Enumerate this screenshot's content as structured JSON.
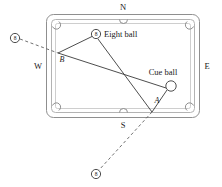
{
  "figure": {
    "type": "billiards-table-diagram",
    "title": "",
    "compass_labels": {
      "north": "N",
      "south": "S",
      "east": "E",
      "west": "W"
    },
    "point_labels": {
      "a": "A",
      "b": "B"
    },
    "annotations": {
      "eight_ball": "Eight ball",
      "cue_ball": "Cue ball"
    },
    "ball_glyph": "8",
    "colors": {
      "rail_stroke": "#8a8a8a",
      "cloth_stroke": "#aaaaaa",
      "line_stroke": "#3a3a3a",
      "dash_stroke": "#555555",
      "ball_fill": "#ffffff",
      "text": "#1a1a1a"
    },
    "geometry": {
      "table_outer": {
        "x": 46,
        "y": 14,
        "w": 154,
        "h": 104
      },
      "eight_ball": {
        "cx": 96,
        "cy": 34,
        "r": 4.6
      },
      "cue_ball": {
        "cx": 171,
        "cy": 86,
        "r": 5.2
      },
      "ghost_ball_west": {
        "cx": 15,
        "cy": 38,
        "r": 4.6
      },
      "ghost_ball_south": {
        "cx": 96,
        "cy": 174,
        "r": 4.6
      },
      "point_a": {
        "x": 152,
        "y": 112
      },
      "point_b": {
        "x": 58,
        "y": 53
      },
      "crossing": {
        "x": 128,
        "y": 72
      }
    }
  }
}
